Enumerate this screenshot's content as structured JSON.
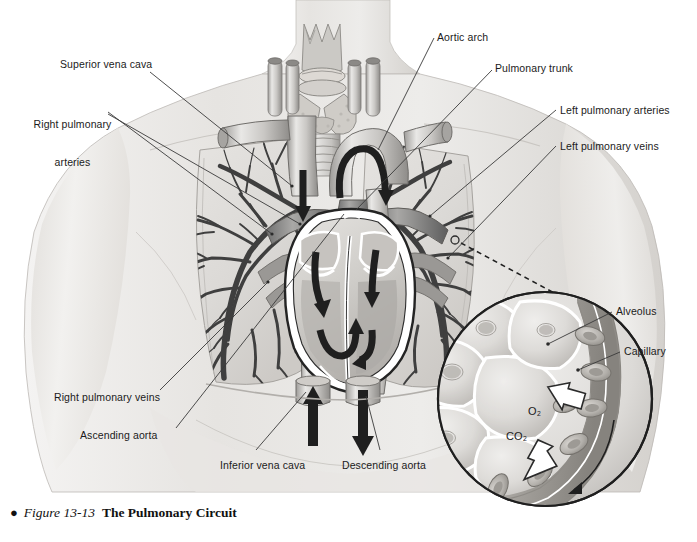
{
  "figure": {
    "bullet": "●",
    "number": "Figure 13-13",
    "title": "The Pulmonary Circuit"
  },
  "labels": {
    "superior_vena_cava": "Superior vena cava",
    "right_pulmonary_arteries_l1": "Right pulmonary",
    "right_pulmonary_arteries_l2": "arteries",
    "aortic_arch": "Aortic arch",
    "pulmonary_trunk": "Pulmonary trunk",
    "left_pulmonary_arteries": "Left pulmonary arteries",
    "left_pulmonary_veins": "Left pulmonary veins",
    "right_pulmonary_veins": "Right pulmonary veins",
    "ascending_aorta": "Ascending aorta",
    "inferior_vena_cava": "Inferior vena cava",
    "descending_aorta": "Descending aorta",
    "alveolus": "Alveolus",
    "capillary": "Capillary",
    "oxygen": "O₂",
    "carbon_dioxide": "CO₂"
  },
  "colors": {
    "background": "#ffffff",
    "text": "#1b1b1b",
    "leader_line": "#3a3a3a",
    "skin_light": "#ecebe9",
    "skin_mid": "#dcdad7",
    "skin_shadow": "#c6c3bf",
    "lung_field": "#dedcda",
    "vessel_dark": "#4a4a4a",
    "vessel_mid": "#8d8d8d",
    "vessel_light": "#cfcdca",
    "heart_outline": "#2b2b2b",
    "arrow_dark": "#262626",
    "inset_stroke": "#222222",
    "alveolus_fill": "#d6d4d1",
    "rbc_fill": "#b9b6b2"
  },
  "diagram": {
    "type": "anatomical-illustration",
    "subject": "pulmonary circuit",
    "view": "anterior thoracic cut-away",
    "structures": [
      "larynx",
      "thyroid gland",
      "trachea",
      "right lung",
      "left lung",
      "bronchial / pulmonary vascular tree",
      "heart (frontal section)",
      "superior vena cava",
      "inferior vena cava",
      "aortic arch",
      "ascending aorta",
      "descending aorta",
      "pulmonary trunk",
      "left and right pulmonary arteries",
      "left and right pulmonary veins",
      "alveolar sacs",
      "pulmonary capillary with erythrocytes"
    ],
    "inset": {
      "kind": "magnified circular detail",
      "contents": [
        "alveoli",
        "capillary",
        "red blood cells",
        "gas exchange arrows"
      ],
      "gas_exchange": [
        {
          "gas": "O₂",
          "direction": "alveolus to blood"
        },
        {
          "gas": "CO₂",
          "direction": "blood to alveolus"
        }
      ]
    }
  }
}
